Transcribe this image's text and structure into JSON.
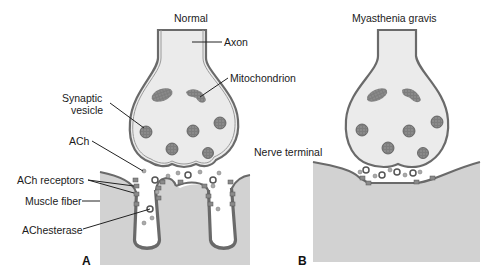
{
  "panels": {
    "a": {
      "letter": "A",
      "title": "Normal"
    },
    "b": {
      "letter": "B",
      "title": "Myasthenia gravis"
    }
  },
  "labels": {
    "axon": "Axon",
    "mitochondrion": "Mitochondrion",
    "synaptic_vesicle_1": "Synaptic",
    "synaptic_vesicle_2": "vesicle",
    "ach": "ACh",
    "ach_receptors": "ACh receptors",
    "muscle_fiber": "Muscle fiber",
    "achesterase": "AChesterase",
    "nerve_terminal": "Nerve terminal"
  },
  "colors": {
    "muscle_fill": "#d2d2d2",
    "terminal_fill": "#ebebeb",
    "membrane": "#6a6a6a",
    "organelle": "#8a8a8a"
  }
}
